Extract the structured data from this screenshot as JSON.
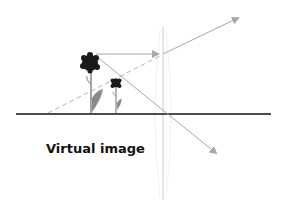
{
  "diagram": {
    "label": "Virtual image",
    "elements": {
      "optical_axis": "optical-axis",
      "lens": "converging-lens",
      "object": "small-flower-object",
      "image": "large-flower-virtual-image",
      "rays": [
        {
          "name": "parallel-ray",
          "description": "Parallel to axis, refracted through focal point"
        },
        {
          "name": "center-ray",
          "description": "Passes undeviated through lens center"
        },
        {
          "name": "virtual-extension",
          "description": "Dashed backward extension of refracted ray"
        }
      ]
    },
    "colors": {
      "axis": "#111111",
      "ray": "#a8a8a8",
      "lens": "#d0d0d0",
      "flower_head": "#1a1a1a",
      "leaf": "#8a8a8a"
    }
  }
}
